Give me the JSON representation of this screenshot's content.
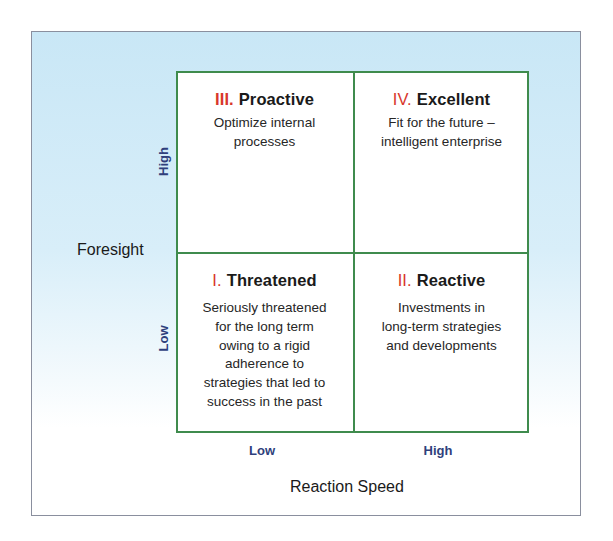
{
  "diagram": {
    "type": "2x2-matrix",
    "y_axis": {
      "title": "Foresight",
      "low": "Low",
      "high": "High"
    },
    "x_axis": {
      "title": "Reaction Speed",
      "low": "Low",
      "high": "High"
    },
    "quadrants": {
      "q1": {
        "numeral": "I.",
        "name": "Threatened",
        "position": "low-foresight / low-speed",
        "lines": [
          "Seriously threatened",
          "for the long term",
          "owing to a rigid",
          "adherence to",
          "strategies that led to",
          "success in the past"
        ]
      },
      "q2": {
        "numeral": "II.",
        "name": "Reactive",
        "position": "low-foresight / high-speed",
        "lines": [
          "Investments in",
          "long-term strategies",
          "and developments"
        ]
      },
      "q3": {
        "numeral": "III.",
        "name": "Proactive",
        "position": "high-foresight / low-speed",
        "lines": [
          "Optimize internal",
          "processes"
        ]
      },
      "q4": {
        "numeral": "IV.",
        "name": "Excellent",
        "position": "high-foresight / high-speed",
        "lines": [
          "Fit for the future –",
          "intelligent enterprise"
        ]
      }
    },
    "colors": {
      "grid_border": "#3f8b4d",
      "numeral": "#d8372c",
      "axis_tick_label": "#2f3f7c",
      "background_top": "#c9e7f6",
      "background_bottom": "#ffffff",
      "frame_border": "#8a8f9e"
    }
  }
}
